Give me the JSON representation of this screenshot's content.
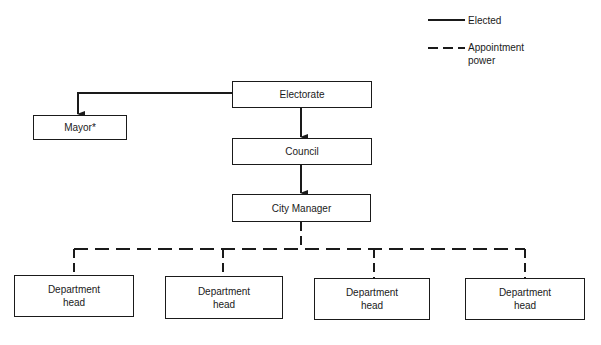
{
  "legend": {
    "elected_label": "Elected",
    "appointment_label_line1": "Appointment",
    "appointment_label_line2": "power"
  },
  "nodes": {
    "electorate": "Electorate",
    "mayor": "Mayor*",
    "council": "Council",
    "city_manager": "City Manager",
    "department_heads": [
      {
        "line1": "Department",
        "line2": "head"
      },
      {
        "line1": "Department",
        "line2": "head"
      },
      {
        "line1": "Department",
        "line2": "head"
      },
      {
        "line1": "Department",
        "line2": "head"
      }
    ]
  },
  "colors": {
    "ink": "#1a1a1a",
    "background": "#ffffff"
  }
}
